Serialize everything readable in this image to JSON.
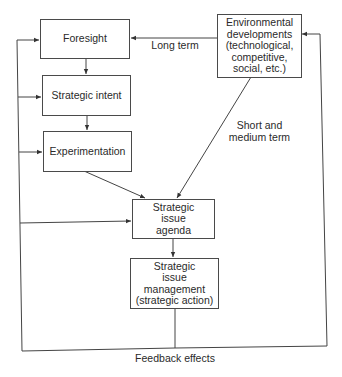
{
  "diagram": {
    "nodes": {
      "foresight": "Foresight",
      "strategic_intent": "Strategic intent",
      "experimentation": "Experimentation",
      "environmental": "Environmental\ndevelopments\n(technological,\ncompetitive,\nsocial, etc.)",
      "agenda": "Strategic\nissue\nagenda",
      "management": "Strategic\nissue\nmanagement\n(strategic action)"
    },
    "edge_labels": {
      "long_term": "Long term",
      "short_medium_term": "Short and\nmedium term",
      "feedback": "Feedback effects"
    },
    "edges": [
      {
        "from": "environmental",
        "to": "foresight",
        "label": "Long term"
      },
      {
        "from": "environmental",
        "to": "agenda",
        "label": "Short and medium term"
      },
      {
        "from": "foresight",
        "to": "strategic_intent"
      },
      {
        "from": "strategic_intent",
        "to": "experimentation"
      },
      {
        "from": "experimentation",
        "to": "agenda"
      },
      {
        "from": "agenda",
        "to": "management"
      },
      {
        "from": "management",
        "to": "foresight",
        "label": "Feedback effects"
      },
      {
        "from": "management",
        "to": "strategic_intent",
        "label": "Feedback effects"
      },
      {
        "from": "management",
        "to": "experimentation",
        "label": "Feedback effects"
      },
      {
        "from": "management",
        "to": "agenda",
        "label": "Feedback effects"
      },
      {
        "from": "management",
        "to": "environmental",
        "label": "Feedback effects"
      }
    ]
  }
}
